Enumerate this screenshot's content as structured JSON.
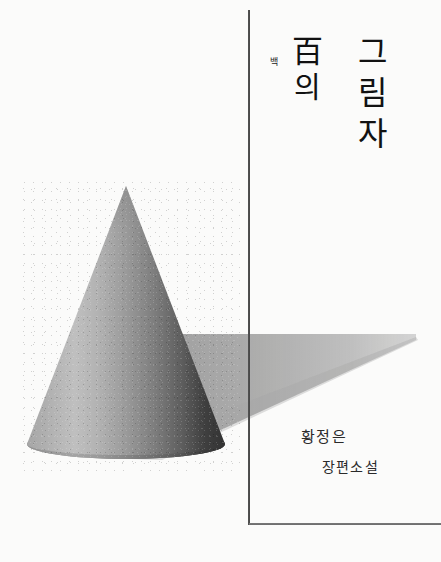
{
  "cover": {
    "background_color": "#fbfbfa",
    "width": 441,
    "height": 562
  },
  "title": {
    "ruby_annotation": "백",
    "hanja": "百",
    "particle": "의",
    "hangul_column": [
      "그",
      "림",
      "자"
    ],
    "full_title": "백의 그림자",
    "color": "#111111"
  },
  "author": {
    "name": "황정은",
    "color": "#2a2a2a"
  },
  "subtitle": {
    "label": "장편소설",
    "color": "#2a2a2a"
  },
  "artwork": {
    "cone": {
      "name": "cone-illustration",
      "apex_x": 126,
      "apex_y": 188,
      "base_center_x": 126,
      "base_center_y": 448,
      "base_half_width": 99,
      "base_ellipse_ry": 14,
      "light_color": "#c2c2c2",
      "mid_color": "#8f8f8f",
      "dark_color": "#343434"
    },
    "shadow": {
      "name": "cast-shadow",
      "tip_x": 416,
      "tip_y": 334,
      "color": "#9a9a9a",
      "opacity": 0.78
    }
  },
  "rules": {
    "vertical": {
      "x": 248,
      "top": 10,
      "bottom": 525,
      "color": "#1a1a1a"
    },
    "horizontal": {
      "y": 523,
      "left": 249,
      "right": 441,
      "color": "#3d3d3d"
    }
  }
}
